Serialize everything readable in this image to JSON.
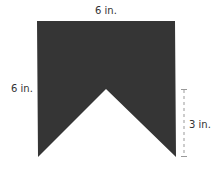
{
  "diagram": {
    "labels": {
      "top_width": "6 in.",
      "left_height": "6 in.",
      "notch_depth": "3 in."
    },
    "shape": {
      "fill": "#353535",
      "points": "37,21 175,21 176,157 106,89 38,157"
    },
    "dimension_line": {
      "color": "#999999",
      "x": 184,
      "y1": 89,
      "y2": 157
    }
  }
}
